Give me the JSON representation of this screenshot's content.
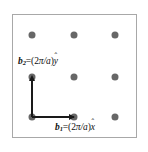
{
  "figure": {
    "name": "reciprocal-lattice-diagram",
    "frame": {
      "border_color": "#a8a8a8",
      "background_color": "#ffffff",
      "x": 12,
      "y": 14,
      "width": 125,
      "height": 124
    },
    "lattice": {
      "point_color": "#676767",
      "point_diameter": 7,
      "columns_x": [
        32,
        74,
        115
      ],
      "rows_y": [
        35,
        77,
        117
      ],
      "points": [
        {
          "x": 32,
          "y": 35
        },
        {
          "x": 74,
          "y": 35
        },
        {
          "x": 115,
          "y": 35
        },
        {
          "x": 32,
          "y": 77
        },
        {
          "x": 74,
          "y": 77
        },
        {
          "x": 115,
          "y": 77
        },
        {
          "x": 32,
          "y": 117
        },
        {
          "x": 74,
          "y": 117
        },
        {
          "x": 115,
          "y": 117
        }
      ]
    },
    "vectors": [
      {
        "id": "b1",
        "symbol": "b",
        "subscript": "1",
        "equals": "=(2",
        "pi": "π",
        "over_a": "/a",
        "close": ")",
        "unit": "x",
        "hat": "ˆ",
        "label_text": "b₁=(2π/a)x̂",
        "direction": "horizontal",
        "origin": {
          "x": 32,
          "y": 117
        },
        "tip": {
          "x": 74,
          "y": 117
        },
        "color": "#1a1a1a"
      },
      {
        "id": "b2",
        "symbol": "b",
        "subscript": "2",
        "equals": "=(2",
        "pi": "π",
        "over_a": "/a",
        "close": ")",
        "unit": "y",
        "hat": "ˆ",
        "label_text": "b₂=(2π/a)ŷ",
        "direction": "vertical",
        "origin": {
          "x": 32,
          "y": 117
        },
        "tip": {
          "x": 32,
          "y": 77
        },
        "color": "#1a1a1a"
      }
    ]
  }
}
